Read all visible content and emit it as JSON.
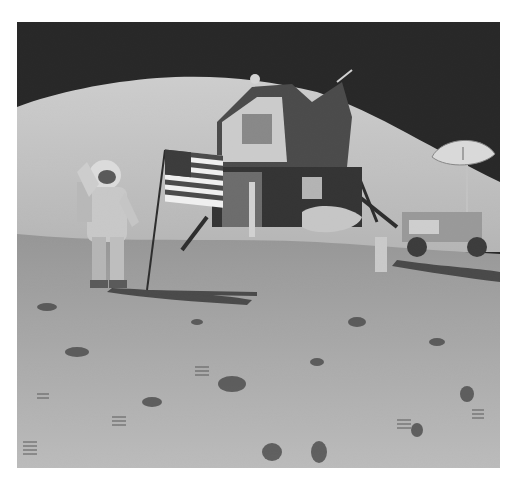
{
  "image": {
    "subject": "Astronaut saluting flag on the lunar surface beside lunar module and rover",
    "style": "black-and-white photograph",
    "colors": {
      "sky": "#1c1c1c",
      "hill": "#cfcfcf",
      "ground": "#a9a9a9",
      "page_background": "#ffffff"
    },
    "elements": [
      "astronaut",
      "flag",
      "lunar-module",
      "lunar-rover",
      "high-gain-antenna",
      "hill",
      "lunar-surface",
      "footprints",
      "rocks"
    ]
  }
}
